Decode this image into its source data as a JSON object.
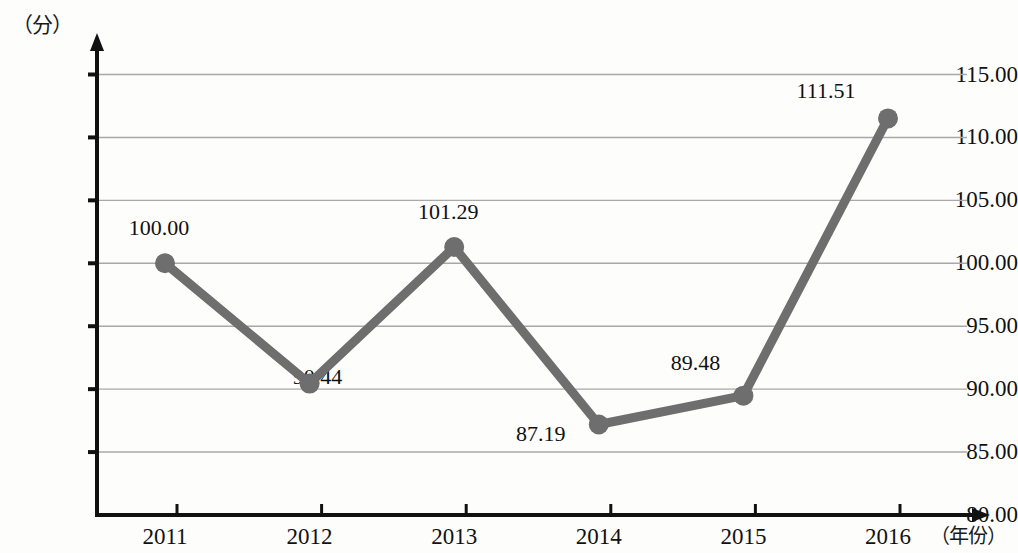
{
  "chart_data": {
    "type": "line",
    "title": "",
    "xlabel": "（年份）",
    "ylabel": "（分）",
    "categories": [
      "2011",
      "2012",
      "2013",
      "2014",
      "2015",
      "2016"
    ],
    "values": [
      100.0,
      90.44,
      101.29,
      87.19,
      89.48,
      111.51
    ],
    "point_labels": [
      "100.00",
      "90.44",
      "101.29",
      "87.19",
      "89.48",
      "111.51"
    ],
    "ytick_labels": [
      "115.00",
      "110.00",
      "105.00",
      "100.00",
      "95.00",
      "90.00",
      "85.00",
      "80.00"
    ],
    "ytick_values": [
      115,
      110,
      105,
      100,
      95,
      90,
      85,
      80
    ],
    "ylim": [
      80,
      115
    ],
    "grid": true,
    "legend": "none",
    "series_color": "#6e6e6e",
    "axis_color": "#111111",
    "grid_color": "#a8a8a8"
  }
}
